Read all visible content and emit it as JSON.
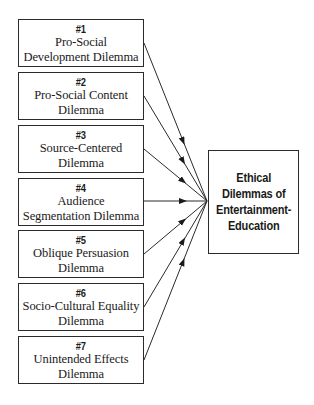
{
  "diagram": {
    "type": "converging-flow",
    "sources": [
      {
        "number": "#1",
        "label": "Pro-Social\nDevelopment Dilemma"
      },
      {
        "number": "#2",
        "label": "Pro-Social Content\nDilemma"
      },
      {
        "number": "#3",
        "label": "Source-Centered\nDilemma"
      },
      {
        "number": "#4",
        "label": "Audience\nSegmentation Dilemma"
      },
      {
        "number": "#5",
        "label": "Oblique Persuasion\nDilemma"
      },
      {
        "number": "#6",
        "label": "Socio-Cultural Equality\nDilemma"
      },
      {
        "number": "#7",
        "label": "Unintended Effects\nDilemma"
      }
    ],
    "target": {
      "label": "Ethical\nDilemmas of\nEntertainment-\nEducation"
    },
    "colors": {
      "line": "#2b2b2b",
      "text": "#1a1a1a",
      "background": "#ffffff"
    }
  }
}
